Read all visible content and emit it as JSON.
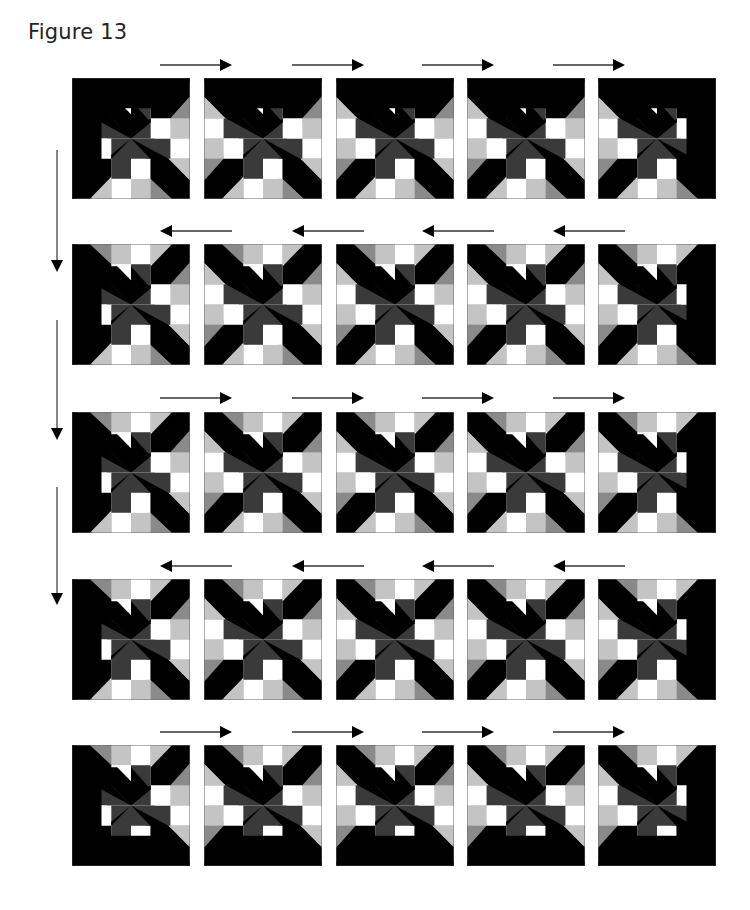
{
  "figure": {
    "title": "Figure 13"
  },
  "colors": {
    "black": "#000000",
    "dark_gray": "#3a3a3a",
    "mid_gray": "#8a8a8a",
    "light_gray": "#c4c4c4",
    "white": "#ffffff",
    "grid_line": "#6a6a6a"
  },
  "layout": {
    "rows": 5,
    "cols": 5,
    "row_directions": [
      "right",
      "left",
      "right",
      "left",
      "right"
    ],
    "down_arrows": 3
  },
  "blocks": [
    {
      "row": 1,
      "col": 1,
      "variant": "corner-top-left"
    },
    {
      "row": 1,
      "col": 2,
      "variant": "edge-top"
    },
    {
      "row": 1,
      "col": 3,
      "variant": "edge-top"
    },
    {
      "row": 1,
      "col": 4,
      "variant": "edge-top"
    },
    {
      "row": 1,
      "col": 5,
      "variant": "corner-top-right"
    },
    {
      "row": 2,
      "col": 1,
      "variant": "edge-left"
    },
    {
      "row": 2,
      "col": 2,
      "variant": "interior"
    },
    {
      "row": 2,
      "col": 3,
      "variant": "interior"
    },
    {
      "row": 2,
      "col": 4,
      "variant": "interior"
    },
    {
      "row": 2,
      "col": 5,
      "variant": "edge-right"
    },
    {
      "row": 3,
      "col": 1,
      "variant": "edge-left"
    },
    {
      "row": 3,
      "col": 2,
      "variant": "interior"
    },
    {
      "row": 3,
      "col": 3,
      "variant": "interior"
    },
    {
      "row": 3,
      "col": 4,
      "variant": "interior"
    },
    {
      "row": 3,
      "col": 5,
      "variant": "edge-right"
    },
    {
      "row": 4,
      "col": 1,
      "variant": "edge-left"
    },
    {
      "row": 4,
      "col": 2,
      "variant": "interior"
    },
    {
      "row": 4,
      "col": 3,
      "variant": "interior"
    },
    {
      "row": 4,
      "col": 4,
      "variant": "interior"
    },
    {
      "row": 4,
      "col": 5,
      "variant": "edge-right"
    },
    {
      "row": 5,
      "col": 1,
      "variant": "corner-bottom-left"
    },
    {
      "row": 5,
      "col": 2,
      "variant": "edge-bottom"
    },
    {
      "row": 5,
      "col": 3,
      "variant": "edge-bottom"
    },
    {
      "row": 5,
      "col": 4,
      "variant": "edge-bottom"
    },
    {
      "row": 5,
      "col": 5,
      "variant": "corner-bottom-right"
    }
  ],
  "icons": {
    "right_arrow": "arrow-right-icon",
    "left_arrow": "arrow-left-icon",
    "down_arrow": "arrow-down-icon"
  }
}
